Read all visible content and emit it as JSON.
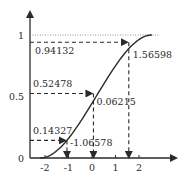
{
  "chart_data": {
    "type": "line",
    "title": "",
    "xlabel": "",
    "ylabel": "",
    "xlim": [
      -2.6,
      2.8
    ],
    "ylim": [
      0,
      1.1
    ],
    "grid": false,
    "x_ticks": [
      -2,
      -1,
      0,
      1,
      2
    ],
    "x_tick_labels": [
      "-2",
      "-1",
      "0",
      "1",
      "2"
    ],
    "y_ticks": [
      0,
      0.5,
      1
    ],
    "y_tick_labels": [
      "0",
      "0.5",
      "1"
    ],
    "series": [
      {
        "name": "CDF curve",
        "style": "solid",
        "description": "S-shaped cumulative distribution rising from 0 near x=-2.2 to 1 near x=2.5"
      }
    ],
    "asymptote": {
      "y": 1,
      "style": "dotted"
    },
    "mappings": [
      {
        "y": 0.14327,
        "x": -1.06578,
        "y_label": "0.14327",
        "x_label": "-1.06578"
      },
      {
        "y": 0.52478,
        "x": 0.06215,
        "y_label": "0.52478",
        "x_label": "0.06215"
      },
      {
        "y": 0.94132,
        "x": 1.56598,
        "y_label": "0.94132",
        "x_label": "1.56598"
      }
    ]
  },
  "colors": {
    "ink": "#2a2a2a",
    "background": "#ffffff"
  }
}
